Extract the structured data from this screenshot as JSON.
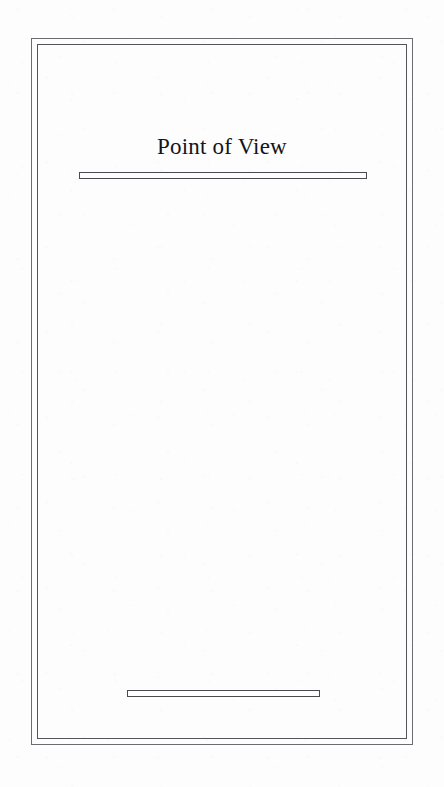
{
  "page": {
    "kind": "book-title-page",
    "paper_color": "#fdfdfd",
    "ink_color": "#14141a",
    "rule_color": "#4a4a50",
    "frame_color": "#6b6b70",
    "width": 444,
    "height": 787
  },
  "frame": {
    "outer_label": "outer border rule",
    "inner_label": "inner border rule"
  },
  "title_block": {
    "title": "Point of View"
  },
  "rules": {
    "title_rule_label": "title underline bar",
    "footer_rule_label": "footer bar"
  },
  "body": {
    "content": ""
  }
}
